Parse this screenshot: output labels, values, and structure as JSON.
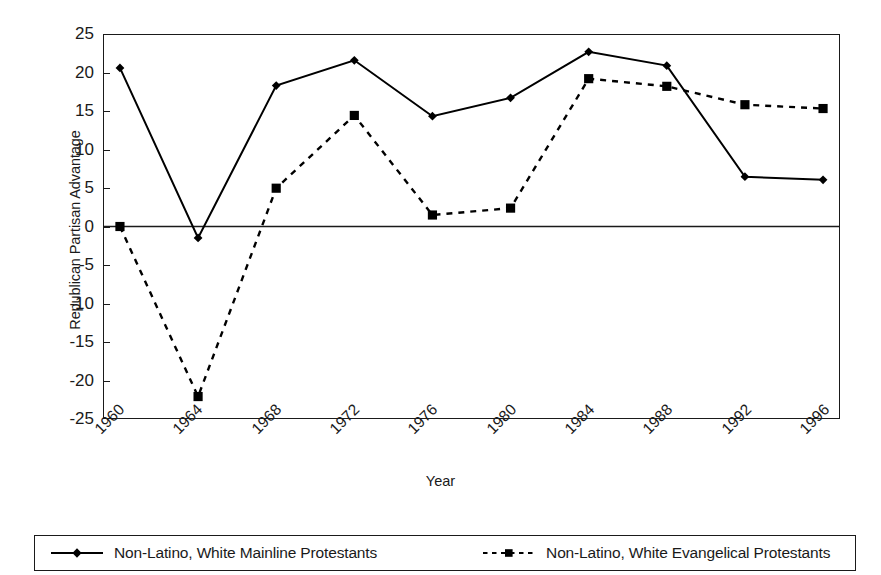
{
  "chart_data": {
    "type": "line",
    "title": "",
    "xlabel": "Year",
    "ylabel": "Republican Partisan Advantage",
    "x": [
      1960,
      1964,
      1968,
      1972,
      1976,
      1980,
      1984,
      1988,
      1992,
      1996
    ],
    "categories": [
      "1960",
      "1964",
      "1968",
      "1972",
      "1976",
      "1980",
      "1984",
      "1988",
      "1992",
      "1996"
    ],
    "xlim": [
      1958,
      1998
    ],
    "ylim": [
      -25,
      25
    ],
    "ytick_labels": [
      "25",
      "20",
      "15",
      "10",
      "5",
      "0",
      "-5",
      "-10",
      "-15",
      "-20",
      "-25"
    ],
    "yticks": [
      25,
      20,
      15,
      10,
      5,
      0,
      -5,
      -10,
      -15,
      -20,
      -25
    ],
    "grid": false,
    "legend_position": "bottom",
    "zero_line": true,
    "series": [
      {
        "name": "Non-Latino, White Mainline Protestants",
        "marker": "diamond",
        "linestyle": "solid",
        "color": "#000000",
        "values": [
          20.7,
          -1.5,
          18.4,
          21.7,
          14.4,
          16.8,
          22.8,
          21.0,
          6.5,
          6.1
        ]
      },
      {
        "name": "Non-Latino, White Evangelical Protestants",
        "marker": "square",
        "linestyle": "dashed",
        "color": "#000000",
        "values": [
          0.0,
          -22.2,
          5.0,
          14.5,
          1.5,
          2.4,
          19.3,
          18.3,
          15.9,
          15.4
        ]
      }
    ]
  },
  "axis": {
    "x_title": "Year",
    "y_title": "Republican Partisan Advantage"
  },
  "legend": {
    "entries": [
      {
        "label": "Non-Latino, White Mainline Protestants",
        "marker_icon": "diamond-marker-icon",
        "line_icon": "solid-line-icon"
      },
      {
        "label": "Non-Latino, White Evangelical Protestants",
        "marker_icon": "square-marker-icon",
        "line_icon": "dashed-line-icon"
      }
    ]
  }
}
